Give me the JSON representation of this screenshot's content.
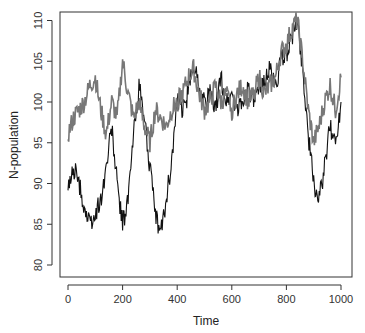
{
  "chart_data": {
    "type": "line",
    "title": "",
    "xlabel": "Time",
    "ylabel": "N-population",
    "xlim": [
      0,
      1000
    ],
    "ylim": [
      79,
      111
    ],
    "xticks": [
      0,
      200,
      400,
      600,
      800,
      1000
    ],
    "yticks": [
      80,
      85,
      90,
      95,
      100,
      105,
      110
    ],
    "grid": false,
    "legend": null,
    "x": [
      0,
      20,
      40,
      60,
      80,
      100,
      120,
      140,
      160,
      180,
      200,
      220,
      240,
      260,
      280,
      300,
      320,
      340,
      360,
      380,
      400,
      420,
      440,
      460,
      480,
      500,
      520,
      540,
      560,
      580,
      600,
      620,
      640,
      660,
      680,
      700,
      720,
      740,
      760,
      780,
      800,
      820,
      840,
      860,
      880,
      900,
      920,
      940,
      960,
      980,
      1000
    ],
    "series": [
      {
        "name": "series-black",
        "color": "#111111",
        "values": [
          89,
          92,
          90,
          87,
          85,
          86,
          88,
          92,
          97,
          90,
          85,
          88,
          96,
          102,
          98,
          92,
          86,
          84,
          88,
          93,
          100,
          99,
          101,
          105,
          102,
          100,
          101,
          99,
          103,
          100,
          101,
          99,
          100,
          102,
          100,
          101,
          103,
          104,
          102,
          105,
          106,
          108,
          110,
          104,
          96,
          90,
          88,
          92,
          97,
          95,
          100
        ]
      },
      {
        "name": "series-gray",
        "color": "#777777",
        "values": [
          96,
          98,
          99,
          100,
          102,
          103,
          99,
          96,
          100,
          98,
          105,
          101,
          98,
          100,
          97,
          95,
          99,
          98,
          97,
          99,
          100,
          101,
          103,
          104,
          101,
          99,
          100,
          102,
          100,
          101,
          99,
          101,
          102,
          100,
          101,
          103,
          101,
          102,
          103,
          106,
          107,
          109,
          110,
          105,
          99,
          95,
          97,
          100,
          102,
          99,
          103
        ]
      }
    ]
  },
  "header": {
    "cut_title": ""
  }
}
